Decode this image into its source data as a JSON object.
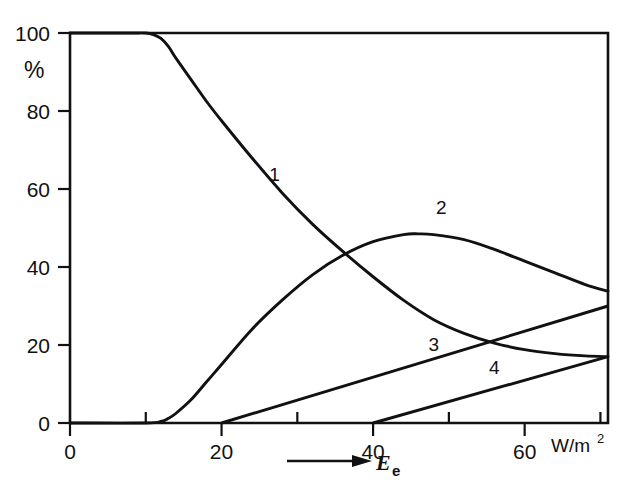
{
  "chart_data": {
    "type": "line",
    "title": "",
    "xlabel": "E_e",
    "xlabel_display": "E",
    "xlabel_subscript": "e",
    "xunits": "W/m",
    "xunits_exponent": "2",
    "ylabel": "%",
    "xlim": [
      0,
      71
    ],
    "ylim": [
      0,
      100
    ],
    "grid": false,
    "legend_position": "inline-curve-labels",
    "x_ticks_major": [
      0,
      20,
      40,
      60
    ],
    "x_ticks_minor": [
      10,
      30,
      50,
      70
    ],
    "x_tick_labels": [
      "0",
      "20",
      "40",
      "60"
    ],
    "y_ticks": [
      0,
      20,
      40,
      60,
      80,
      100
    ],
    "y_tick_labels": [
      "0",
      "20",
      "40",
      "60",
      "80",
      "100"
    ],
    "series": [
      {
        "name": "1",
        "label": "1",
        "label_x": 27,
        "label_y": 62,
        "x": [
          0,
          4,
          8,
          10,
          11,
          12,
          13,
          14,
          16,
          18,
          20,
          24,
          28,
          32,
          36,
          40,
          44,
          48,
          52,
          56,
          60,
          64,
          68,
          71
        ],
        "y": [
          100,
          100,
          100,
          100,
          99.6,
          98.6,
          96.5,
          93.5,
          88.0,
          82.5,
          77.5,
          68.0,
          59.0,
          51.0,
          44.0,
          37.5,
          31.5,
          26.5,
          23.0,
          20.5,
          18.8,
          17.8,
          17.2,
          17.0
        ]
      },
      {
        "name": "2",
        "label": "2",
        "label_x": 49,
        "label_y": 53.5,
        "x": [
          0,
          10,
          12,
          13,
          14,
          16,
          18,
          20,
          24,
          28,
          32,
          36,
          40,
          44,
          46,
          48,
          52,
          56,
          60,
          64,
          68,
          71
        ],
        "y": [
          0,
          0,
          0.4,
          1.2,
          2.5,
          6.0,
          10.5,
          15.0,
          24.0,
          31.5,
          38.0,
          43.0,
          46.5,
          48.3,
          48.5,
          48.3,
          47.0,
          44.5,
          41.5,
          38.5,
          35.5,
          33.8
        ]
      },
      {
        "name": "3",
        "label": "3",
        "label_x": 48,
        "label_y": 18.5,
        "x": [
          20,
          71
        ],
        "y": [
          0,
          30
        ]
      },
      {
        "name": "4",
        "label": "4",
        "label_x": 56,
        "label_y": 12.5,
        "x": [
          40,
          71
        ],
        "y": [
          0,
          17
        ]
      }
    ]
  },
  "axes": {
    "y_axis_unit_label": "%",
    "x_axis_arrow_label": "E",
    "x_axis_arrow_subscript": "e",
    "x_axis_units": "W/m",
    "x_axis_units_exponent": "2"
  }
}
